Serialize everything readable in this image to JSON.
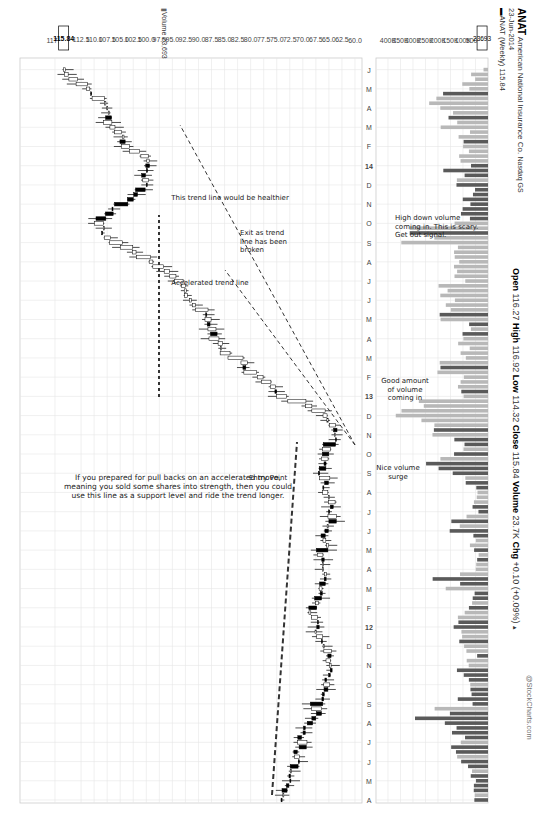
{
  "header": {
    "symbol": "ANAT",
    "company": "American National Insurance Co.",
    "exchange": "Nasdaq GS",
    "date": "23-Jun-2014",
    "series_label": "ANAT (Weekly) 115.84",
    "open_label": "Open",
    "open": "116.27",
    "high_label": "High",
    "high": "116.92",
    "low_label": "Low",
    "low": "114.32",
    "close_label": "Close",
    "close": "115.84",
    "volume_label": "Volume",
    "volume": "23.7K",
    "chg_label": "Chg",
    "chg": "+0.10 (+0.09%)",
    "watermark": "@StockCharts.com",
    "volume_legend": "Volume 23,693"
  },
  "price_axis": {
    "ticks": [
      "117.5",
      "112.5",
      "110.0",
      "107.5",
      "105.0",
      "102.5",
      "100.0",
      "97.5",
      "95.0",
      "92.5",
      "90.0",
      "87.5",
      "85.0",
      "82.5",
      "80.0",
      "77.5",
      "75.0",
      "72.5",
      "70.0",
      "67.5",
      "65.0",
      "62.5",
      "60.0"
    ],
    "last_price_badge": "115.84"
  },
  "volume_axis": {
    "ticks": [
      "400K",
      "350K",
      "300K",
      "250K",
      "200K",
      "150K",
      "100K",
      "50000"
    ],
    "last_volume_badge": "23693"
  },
  "x_axis": {
    "labels": [
      "A",
      "M",
      "J",
      "J",
      "A",
      "S",
      "O",
      "N",
      "D",
      "12",
      "F",
      "M",
      "A",
      "M",
      "J",
      "J",
      "A",
      "S",
      "O",
      "N",
      "D",
      "13",
      "F",
      "M",
      "A",
      "M",
      "J",
      "J",
      "A",
      "S",
      "O",
      "N",
      "D",
      "14",
      "F",
      "M",
      "A",
      "M",
      "J"
    ]
  },
  "annotations": {
    "support_note": [
      "If you prepared for pull backs on an accelerated move,",
      "meaning you sold some shares into strength, then you could",
      "use this line as a support level and ride the trend longer."
    ],
    "entry_point": "Entry Point",
    "accelerated_trend": "Accelerated trend line",
    "healthier_trend": "This trend line would be healthier",
    "exit_note": [
      "Exit as trend",
      "line has been",
      "broken"
    ],
    "nice_volume": [
      "Nice volume",
      "surge"
    ],
    "good_volume": [
      "Good amount",
      "of volume",
      "coming in"
    ],
    "high_down_volume": [
      "High down volume",
      "coming in. This is scary.",
      "Get out signal."
    ]
  },
  "colors": {
    "up_candle": "#ffffff",
    "down_candle": "#000000",
    "volume_up": "#b8b8b8",
    "volume_down": "#5a5a5a",
    "grid": "#e6e6e6"
  },
  "chart_data": {
    "type": "candlestick",
    "subtitle": "23-Jun-2014",
    "xlabel": "",
    "ylabel": "Price",
    "ylim": [
      58.5,
      118.5
    ],
    "grid": true,
    "period": "Weekly, Apr 2011 – Jun 2014",
    "x": [
      "2011-04",
      "2011-05",
      "2011-06",
      "2011-07",
      "2011-08",
      "2011-09",
      "2011-10",
      "2011-11",
      "2011-12",
      "2012-01",
      "2012-02",
      "2012-03",
      "2012-04",
      "2012-05",
      "2012-06",
      "2012-07",
      "2012-08",
      "2012-09",
      "2012-10",
      "2012-11",
      "2012-12",
      "2013-01",
      "2013-02",
      "2013-03",
      "2013-04",
      "2013-05",
      "2013-06",
      "2013-07",
      "2013-08",
      "2013-09",
      "2013-10",
      "2013-11",
      "2013-12",
      "2014-01",
      "2014-02",
      "2014-03",
      "2014-04",
      "2014-05",
      "2014-06"
    ],
    "series": [
      {
        "name": "Close (approx monthly)",
        "values": [
          74,
          73,
          71,
          70,
          68,
          67,
          66,
          65,
          66,
          67,
          68,
          66,
          67,
          66,
          65,
          64,
          66,
          66,
          66,
          63,
          67,
          74,
          79,
          84,
          87,
          89,
          91,
          95,
          100,
          106,
          110,
          104,
          100,
          99,
          104,
          107,
          108,
          112,
          115.84
        ]
      },
      {
        "name": "Volume (approx, K)",
        "values": [
          60,
          70,
          140,
          120,
          230,
          100,
          110,
          70,
          90,
          130,
          60,
          180,
          50,
          70,
          130,
          60,
          70,
          230,
          140,
          240,
          420,
          120,
          160,
          110,
          90,
          150,
          210,
          140,
          110,
          270,
          120,
          80,
          140,
          110,
          100,
          170,
          240,
          80,
          23.7
        ]
      }
    ],
    "last": {
      "open": 116.27,
      "high": 116.92,
      "low": 114.32,
      "close": 115.84,
      "volume": 23693,
      "change": 0.1,
      "change_pct": 0.09
    },
    "annotations": [
      "Support dashed line ~66 (2011) to ~70 (Nov 2012)",
      "Entry Point ~Jan 2013 ~73",
      "Accelerated trend line from Nov 2012 low",
      "Healthier trend line from Nov 2012 low at shallower slope",
      "Exit at ~Oct 2013 break near 101",
      "Nice volume surge Dec 2012",
      "Good amount of volume coming in Feb 2013",
      "High down volume Sep 2013 - get out signal"
    ]
  }
}
